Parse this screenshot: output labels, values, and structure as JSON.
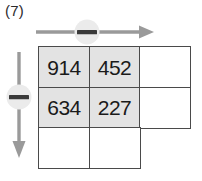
{
  "figure": {
    "label": "(7)",
    "colors": {
      "shaded_cell_fill": "#e3e3e3",
      "empty_cell_fill": "#ffffff",
      "grid_line": "#4a4a4a",
      "arrow": "#9a9a9a",
      "badge_fill": "#ebebeb",
      "badge_minus": "#3a3a3a",
      "text": "#1a1a1a"
    }
  },
  "grid": {
    "columns": 3,
    "rows": 3,
    "cells": [
      {
        "row": 1,
        "col": 1,
        "value": "914",
        "shaded": true,
        "present": true
      },
      {
        "row": 1,
        "col": 2,
        "value": "452",
        "shaded": true,
        "present": true
      },
      {
        "row": 1,
        "col": 3,
        "value": "",
        "shaded": false,
        "present": true
      },
      {
        "row": 2,
        "col": 1,
        "value": "634",
        "shaded": true,
        "present": true
      },
      {
        "row": 2,
        "col": 2,
        "value": "227",
        "shaded": true,
        "present": true
      },
      {
        "row": 2,
        "col": 3,
        "value": "",
        "shaded": false,
        "present": true
      },
      {
        "row": 3,
        "col": 1,
        "value": "",
        "shaded": false,
        "present": true
      },
      {
        "row": 3,
        "col": 2,
        "value": "",
        "shaded": false,
        "present": true
      },
      {
        "row": 3,
        "col": 3,
        "value": "",
        "shaded": false,
        "present": false
      }
    ]
  },
  "arrows": {
    "horizontal": {
      "direction": "right",
      "badge_symbol": "minus"
    },
    "vertical": {
      "direction": "down",
      "badge_symbol": "minus"
    }
  }
}
